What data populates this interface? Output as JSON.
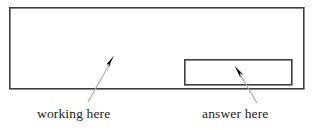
{
  "figure": {
    "background_color": "#ffffff",
    "stroke_color": "#3a3a3a",
    "arrow_color": "#a6a6a6",
    "arrowhead_color": "#111111",
    "text_color": "#1a1a1a"
  },
  "working_area": {
    "name": "working area",
    "x": 9,
    "y": 7,
    "width": 295,
    "height": 82,
    "border_width": 1.6,
    "fill": "#ffffff"
  },
  "answer_box": {
    "name": "answer box",
    "x": 184,
    "y": 59,
    "width": 108,
    "height": 26,
    "border_width": 1.6,
    "fill": "#ffffff"
  },
  "annotations": [
    {
      "id": "working-here",
      "label": "working here",
      "arrow": {
        "tail_x": 88,
        "tail_y": 102,
        "tip_x": 114,
        "tip_y": 56
      }
    },
    {
      "id": "answer-here",
      "label": "answer here",
      "arrow": {
        "tail_x": 257,
        "tail_y": 103,
        "tip_x": 235,
        "tip_y": 66
      }
    }
  ],
  "labels": {
    "working": "working here",
    "answer": "answer here"
  }
}
